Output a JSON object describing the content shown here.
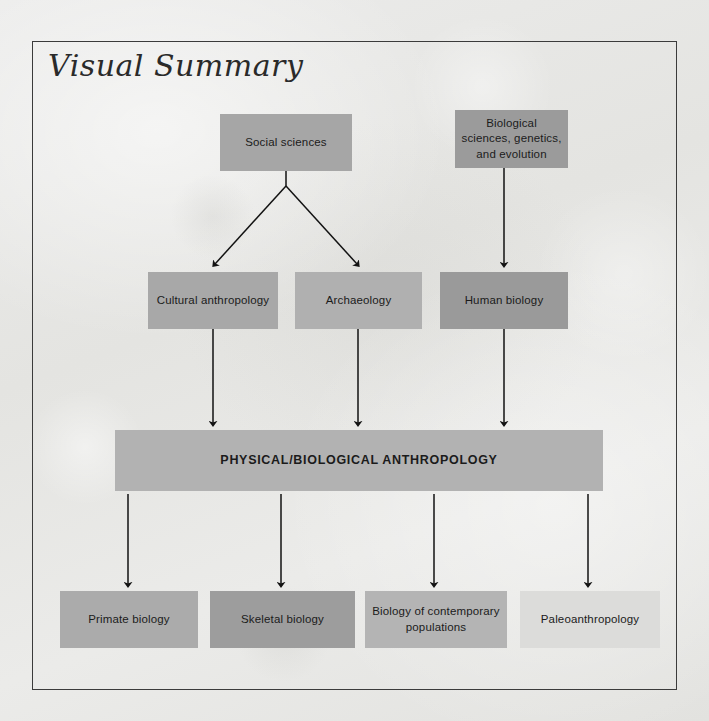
{
  "page": {
    "title": "Visual Summary",
    "background_color": "#e7e7e4",
    "frame_color": "#3b3b3b"
  },
  "chart_data": {
    "type": "diagram",
    "title": "Visual Summary",
    "nodes": [
      {
        "id": "social-sciences",
        "label": "Social sciences",
        "row": 1,
        "color": "#a6a6a6",
        "x": 220,
        "y": 114,
        "w": 132,
        "h": 57
      },
      {
        "id": "biological-sciences",
        "label": "Biological sciences, genetics, and evolution",
        "row": 1,
        "color": "#9b9b9b",
        "x": 455,
        "y": 110,
        "w": 113,
        "h": 58
      },
      {
        "id": "cultural-anthropology",
        "label": "Cultural anthropology",
        "row": 2,
        "color": "#a8a8a8",
        "x": 148,
        "y": 272,
        "w": 130,
        "h": 57
      },
      {
        "id": "archaeology",
        "label": "Archaeology",
        "row": 2,
        "color": "#b0b0b0",
        "x": 295,
        "y": 272,
        "w": 127,
        "h": 57
      },
      {
        "id": "human-biology",
        "label": "Human biology",
        "row": 2,
        "color": "#9a9a9a",
        "x": 440,
        "y": 272,
        "w": 128,
        "h": 57
      },
      {
        "id": "physical-biological-anthropology",
        "label": "PHYSICAL/BIOLOGICAL ANTHROPOLOGY",
        "row": 3,
        "color": "#b2b2b2",
        "x": 115,
        "y": 430,
        "w": 488,
        "h": 61
      },
      {
        "id": "primate-biology",
        "label": "Primate biology",
        "row": 4,
        "color": "#ababab",
        "x": 60,
        "y": 591,
        "w": 138,
        "h": 57
      },
      {
        "id": "skeletal-biology",
        "label": "Skeletal biology",
        "row": 4,
        "color": "#9d9d9d",
        "x": 210,
        "y": 591,
        "w": 145,
        "h": 57
      },
      {
        "id": "biology-contemporary-populations",
        "label": "Biology of contemporary populations",
        "row": 4,
        "color": "#b4b4b4",
        "x": 365,
        "y": 591,
        "w": 142,
        "h": 57
      },
      {
        "id": "paleoanthropology",
        "label": "Paleoanthropology",
        "row": 4,
        "color": "#dcdcda",
        "x": 520,
        "y": 591,
        "w": 140,
        "h": 57
      }
    ],
    "edges": [
      {
        "from": "social-sciences",
        "to": "cultural-anthropology",
        "style": "diagonal"
      },
      {
        "from": "social-sciences",
        "to": "archaeology",
        "style": "diagonal"
      },
      {
        "from": "biological-sciences",
        "to": "human-biology",
        "style": "vertical"
      },
      {
        "from": "cultural-anthropology",
        "to": "physical-biological-anthropology",
        "style": "vertical"
      },
      {
        "from": "archaeology",
        "to": "physical-biological-anthropology",
        "style": "vertical"
      },
      {
        "from": "human-biology",
        "to": "physical-biological-anthropology",
        "style": "vertical"
      },
      {
        "from": "physical-biological-anthropology",
        "to": "primate-biology",
        "style": "vertical"
      },
      {
        "from": "physical-biological-anthropology",
        "to": "skeletal-biology",
        "style": "vertical"
      },
      {
        "from": "physical-biological-anthropology",
        "to": "biology-contemporary-populations",
        "style": "vertical"
      },
      {
        "from": "physical-biological-anthropology",
        "to": "paleoanthropology",
        "style": "vertical"
      }
    ]
  }
}
